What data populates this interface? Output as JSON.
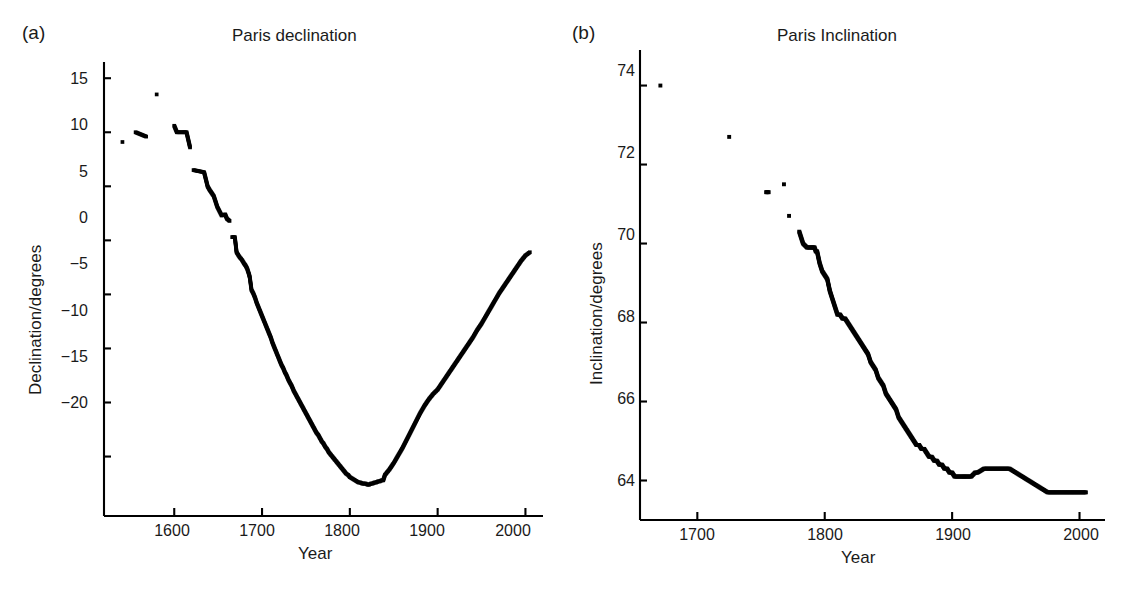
{
  "figure": {
    "panels": [
      {
        "label": "(a)",
        "title": "Paris declination",
        "xlabel": "Year",
        "ylabel": "Declination/degrees",
        "xticks": [
          "1600",
          "1700",
          "1800",
          "1900",
          "2000"
        ],
        "yticks": [
          "15",
          "10",
          "5",
          "0",
          "−5",
          "−10",
          "−15",
          "−20"
        ]
      },
      {
        "label": "(b)",
        "title": "Paris Inclination",
        "xlabel": "Year",
        "ylabel": "Inclination/degrees",
        "xticks": [
          "1700",
          "1800",
          "1900",
          "2000"
        ],
        "yticks": [
          "74",
          "72",
          "70",
          "68",
          "66",
          "64"
        ]
      }
    ]
  },
  "chart_data": [
    {
      "type": "scatter",
      "title": "Paris declination",
      "xlabel": "Year",
      "ylabel": "Declination/degrees",
      "xlim": [
        1520,
        2020
      ],
      "ylim": [
        -25.5,
        16.5
      ],
      "xticks": [
        1600,
        1700,
        1800,
        1900,
        2000
      ],
      "yticks": [
        15,
        10,
        5,
        0,
        -5,
        -10,
        -15,
        -20
      ],
      "grid": false,
      "legend": null,
      "marker": "square",
      "color": "#000000",
      "x": [
        1541,
        1556,
        1568,
        1580,
        1600,
        1603,
        1605,
        1610,
        1614,
        1618,
        1622,
        1634,
        1638,
        1640,
        1645,
        1649,
        1654,
        1658,
        1660,
        1663,
        1666,
        1667,
        1669,
        1671,
        1674,
        1677,
        1680,
        1681,
        1683,
        1685,
        1686,
        1688,
        1690,
        1692,
        1694,
        1696,
        1698,
        1700,
        1702,
        1704,
        1706,
        1708,
        1710,
        1712,
        1714,
        1716,
        1718,
        1720,
        1722,
        1724,
        1726,
        1728,
        1730,
        1732,
        1734,
        1736,
        1738,
        1740,
        1742,
        1744,
        1746,
        1748,
        1750,
        1752,
        1754,
        1756,
        1758,
        1760,
        1762,
        1764,
        1766,
        1768,
        1770,
        1772,
        1774,
        1776,
        1778,
        1780,
        1782,
        1784,
        1786,
        1788,
        1790,
        1792,
        1794,
        1796,
        1798,
        1800,
        1802,
        1804,
        1806,
        1808,
        1810,
        1812,
        1814,
        1816,
        1818,
        1820,
        1822,
        1824,
        1826,
        1828,
        1830,
        1832,
        1834,
        1836,
        1838,
        1840,
        1845,
        1850,
        1855,
        1860,
        1865,
        1870,
        1875,
        1880,
        1885,
        1890,
        1895,
        1900,
        1905,
        1910,
        1915,
        1920,
        1925,
        1930,
        1935,
        1940,
        1945,
        1950,
        1955,
        1960,
        1965,
        1970,
        1975,
        1980,
        1985,
        1990,
        1995,
        2000,
        2005
      ],
      "y": [
        9.1,
        10.0,
        9.6,
        13.5,
        10.6,
        10.0,
        10.0,
        10.0,
        10.0,
        8.6,
        6.5,
        6.3,
        5.0,
        4.7,
        4.1,
        3.1,
        2.3,
        2.4,
        2.0,
        1.8,
        0.3,
        0.3,
        0.3,
        -1.1,
        -1.5,
        -1.8,
        -2.2,
        -2.3,
        -2.6,
        -3.1,
        -3.4,
        -4.6,
        -4.9,
        -5.3,
        -5.8,
        -6.2,
        -6.6,
        -7.0,
        -7.4,
        -7.8,
        -8.2,
        -8.6,
        -9.0,
        -9.5,
        -9.9,
        -10.3,
        -10.7,
        -11.1,
        -11.5,
        -11.8,
        -12.2,
        -12.5,
        -12.9,
        -13.2,
        -13.5,
        -13.9,
        -14.2,
        -14.5,
        -14.8,
        -15.1,
        -15.4,
        -15.7,
        -16.0,
        -16.3,
        -16.6,
        -16.9,
        -17.2,
        -17.5,
        -17.8,
        -18.0,
        -18.3,
        -18.6,
        -18.8,
        -19.1,
        -19.3,
        -19.6,
        -19.8,
        -20.0,
        -20.2,
        -20.4,
        -20.6,
        -20.8,
        -21.0,
        -21.2,
        -21.4,
        -21.6,
        -21.7,
        -21.9,
        -22.0,
        -22.1,
        -22.2,
        -22.3,
        -22.4,
        -22.4,
        -22.5,
        -22.5,
        -22.5,
        -22.6,
        -22.6,
        -22.5,
        -22.5,
        -22.4,
        -22.4,
        -22.3,
        -22.3,
        -22.2,
        -22.2,
        -21.7,
        -21.2,
        -20.6,
        -19.9,
        -19.2,
        -18.4,
        -17.6,
        -16.8,
        -16.0,
        -15.3,
        -14.7,
        -14.2,
        -13.8,
        -13.2,
        -12.6,
        -12.0,
        -11.4,
        -10.8,
        -10.2,
        -9.6,
        -9.0,
        -8.3,
        -7.7,
        -7.0,
        -6.3,
        -5.6,
        -4.9,
        -4.3,
        -3.7,
        -3.1,
        -2.5,
        -1.9,
        -1.4,
        -1.1
      ]
    },
    {
      "type": "scatter",
      "title": "Paris Inclination",
      "xlabel": "Year",
      "ylabel": "Inclination/degrees",
      "xlim": [
        1655,
        2020
      ],
      "ylim": [
        63.0,
        74.9
      ],
      "xticks": [
        1700,
        1800,
        1900,
        2000
      ],
      "yticks": [
        74,
        72,
        70,
        68,
        66,
        64
      ],
      "grid": false,
      "legend": null,
      "marker": "square",
      "color": "#000000",
      "x": [
        1671,
        1725,
        1754,
        1756,
        1768,
        1772,
        1780,
        1783,
        1786,
        1788,
        1790,
        1791,
        1792,
        1793,
        1794,
        1796,
        1798,
        1800,
        1802,
        1804,
        1806,
        1808,
        1810,
        1812,
        1814,
        1816,
        1818,
        1820,
        1822,
        1824,
        1826,
        1828,
        1830,
        1832,
        1834,
        1836,
        1838,
        1840,
        1842,
        1844,
        1846,
        1848,
        1850,
        1852,
        1854,
        1856,
        1858,
        1860,
        1862,
        1864,
        1866,
        1868,
        1870,
        1872,
        1874,
        1876,
        1878,
        1880,
        1882,
        1884,
        1886,
        1888,
        1890,
        1892,
        1894,
        1896,
        1898,
        1900,
        1902,
        1905,
        1908,
        1910,
        1912,
        1915,
        1918,
        1920,
        1925,
        1930,
        1935,
        1940,
        1945,
        1950,
        1955,
        1960,
        1965,
        1970,
        1975,
        1980,
        1985,
        1990,
        1995,
        2000,
        2005
      ],
      "y": [
        74.0,
        72.7,
        71.3,
        71.3,
        71.5,
        70.7,
        70.3,
        70.0,
        69.9,
        69.9,
        69.9,
        69.9,
        69.9,
        69.8,
        69.8,
        69.5,
        69.3,
        69.2,
        69.1,
        68.8,
        68.6,
        68.4,
        68.2,
        68.2,
        68.1,
        68.1,
        68.0,
        67.9,
        67.8,
        67.7,
        67.6,
        67.5,
        67.4,
        67.3,
        67.2,
        67.0,
        66.9,
        66.8,
        66.6,
        66.5,
        66.4,
        66.2,
        66.1,
        66.0,
        65.9,
        65.8,
        65.6,
        65.5,
        65.4,
        65.3,
        65.2,
        65.1,
        65.0,
        64.9,
        64.9,
        64.8,
        64.8,
        64.7,
        64.6,
        64.6,
        64.5,
        64.5,
        64.4,
        64.4,
        64.3,
        64.3,
        64.2,
        64.2,
        64.1,
        64.1,
        64.1,
        64.1,
        64.1,
        64.1,
        64.2,
        64.2,
        64.3,
        64.3,
        64.3,
        64.3,
        64.3,
        64.2,
        64.1,
        64.0,
        63.9,
        63.8,
        63.7,
        63.7,
        63.7,
        63.7,
        63.7,
        63.7,
        63.7
      ]
    }
  ]
}
